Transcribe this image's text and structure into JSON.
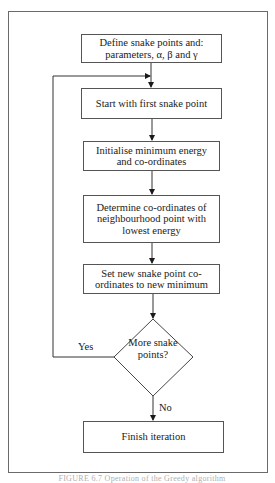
{
  "flowchart": {
    "steps": [
      {
        "id": "define",
        "text": "Define snake points and: parameters, α, β and γ"
      },
      {
        "id": "start",
        "text": "Start with first snake point"
      },
      {
        "id": "init",
        "text": "Initialise minimum energy and co-ordinates"
      },
      {
        "id": "determine",
        "text": "Determine co-ordinates of neighbourhood point with lowest energy"
      },
      {
        "id": "set",
        "text": "Set new snake point co-ordinates to new minimum"
      },
      {
        "id": "finish",
        "text": "Finish iteration"
      }
    ],
    "decision": {
      "text": "More snake points?",
      "yes_label": "Yes",
      "no_label": "No"
    }
  },
  "caption": "FIGURE 6.7 Operation of the Greedy algorithm"
}
